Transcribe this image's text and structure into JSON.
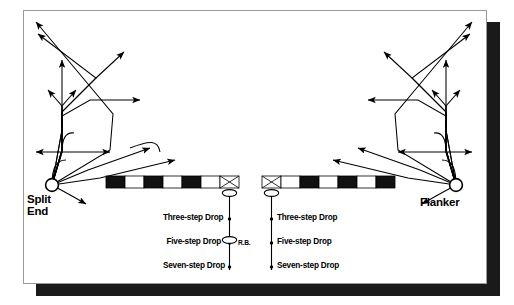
{
  "diagram": {
    "frame": {
      "border_color": "#9a9a9a",
      "shadow_color": "#1a1a1a",
      "background": "#ffffff"
    },
    "positions": [
      {
        "id": "split-end",
        "label_line1": "Split",
        "label_line2": "End",
        "side": "left"
      },
      {
        "id": "flanker",
        "label_line1": "Flanker",
        "label_line2": "",
        "side": "right"
      }
    ],
    "quarterback": {
      "running_back_label": "R.B."
    },
    "drops": {
      "left_column": [
        "Three-step Drop",
        "Five-step Drop",
        "Seven-step Drop"
      ],
      "right_column": [
        "Three-step Drop",
        "Five-step Drop",
        "Seven-step Drop"
      ]
    },
    "line_of_scrimmage": {
      "left_bar_segments": [
        "black",
        "white",
        "black",
        "white",
        "black",
        "white"
      ],
      "right_bar_segments": [
        "white",
        "black",
        "white",
        "black",
        "white",
        "black"
      ],
      "center_symbol": "x-box"
    },
    "colors": {
      "ink": "#000000",
      "paper": "#ffffff",
      "shadow": "#1a1a1a",
      "border": "#9a9a9a"
    },
    "icons": {
      "receiver": "circle-marker",
      "quarterback": "ellipse-marker",
      "center": "x-box-icon",
      "route": "arrow-line"
    }
  }
}
